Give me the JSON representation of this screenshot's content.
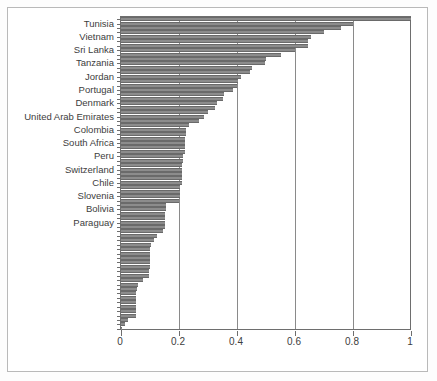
{
  "chart_data": {
    "type": "bar",
    "orientation": "horizontal",
    "title": "",
    "xlabel": "",
    "ylabel": "",
    "xlim": [
      0,
      1
    ],
    "ylim": [
      0,
      48
    ],
    "grid": true,
    "grid_axis": "x",
    "legend": null,
    "xticks": [
      "0",
      "0.2",
      "0.4",
      "0.6",
      "0.8",
      "1"
    ],
    "xtick_values": [
      0,
      0.2,
      0.4,
      0.6,
      0.8,
      1
    ],
    "bar_color": "#8c8c8c",
    "bar_edge_color": "#6a6a6a",
    "axis_color": "#6e6e6e",
    "labeled_categories": [
      "Tunisia",
      "Vietnam",
      "Sri Lanka",
      "Tanzania",
      "Jordan",
      "Portugal",
      "Denmark",
      "United Arab Emirates",
      "Colombia",
      "South Africa",
      "Peru",
      "Switzerland",
      "Chile",
      "Slovenia",
      "Bolivia",
      "Paraguay"
    ],
    "label_interval": 3,
    "values": [
      1.0,
      0.8,
      0.76,
      0.7,
      0.655,
      0.645,
      0.645,
      0.6,
      0.55,
      0.5,
      0.495,
      0.45,
      0.445,
      0.415,
      0.405,
      0.4,
      0.385,
      0.355,
      0.35,
      0.33,
      0.325,
      0.3,
      0.285,
      0.27,
      0.235,
      0.225,
      0.225,
      0.22,
      0.22,
      0.22,
      0.22,
      0.215,
      0.215,
      0.21,
      0.21,
      0.21,
      0.21,
      0.21,
      0.205,
      0.205,
      0.205,
      0.2,
      0.155,
      0.155,
      0.15,
      0.15,
      0.15,
      0.15,
      0.145,
      0.125,
      0.115,
      0.105,
      0.1,
      0.1,
      0.1,
      0.1,
      0.1,
      0.095,
      0.095,
      0.075,
      0.06,
      0.055,
      0.05,
      0.05,
      0.05,
      0.05,
      0.05,
      0.05,
      0.025,
      0.015,
      0.005
    ]
  }
}
